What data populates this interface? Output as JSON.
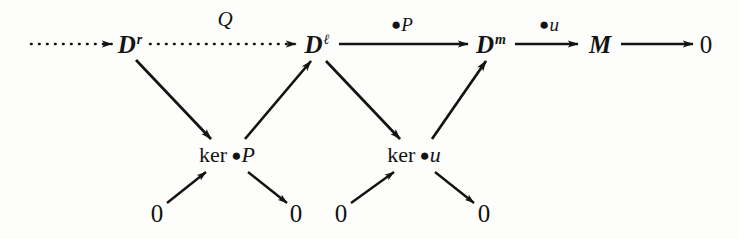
{
  "figure": {
    "kind": "commutative-diagram",
    "background": "#fdfdfb",
    "ink": "#131313",
    "width": 739,
    "height": 239
  },
  "nodes": {
    "d_r": {
      "base": "D",
      "sup": "r"
    },
    "d_l": {
      "base": "D",
      "sup": "ℓ"
    },
    "d_m": {
      "base": "D",
      "sup": "m"
    },
    "m": {
      "base": "M",
      "sup": ""
    },
    "zero_top_right": "0",
    "ker_p": {
      "word": "ker",
      "bullet": "●",
      "op": "P"
    },
    "ker_u": {
      "word": "ker",
      "bullet": "●",
      "op": "u"
    },
    "zero_1": "0",
    "zero_2": "0",
    "zero_3": "0",
    "zero_4": "0"
  },
  "edge_labels": {
    "q": "Q",
    "p": {
      "bullet": "●",
      "op": "P"
    },
    "u": {
      "bullet": "●",
      "op": "u"
    }
  },
  "edges": [
    {
      "name": "incoming-dotted-to-Dr",
      "from": "",
      "to": "d_r",
      "style": "dotted",
      "label": ""
    },
    {
      "name": "Dr-to-Dl",
      "from": "d_r",
      "to": "d_l",
      "style": "dotted",
      "label": "Q"
    },
    {
      "name": "Dl-to-Dm",
      "from": "d_l",
      "to": "d_m",
      "style": "solid",
      "label": "●P"
    },
    {
      "name": "Dm-to-M",
      "from": "d_m",
      "to": "m",
      "style": "solid",
      "label": "●u"
    },
    {
      "name": "M-to-zero",
      "from": "m",
      "to": "zero_top_right",
      "style": "solid",
      "label": ""
    },
    {
      "name": "Dr-to-kerP",
      "from": "d_r",
      "to": "ker_p",
      "style": "solid",
      "label": ""
    },
    {
      "name": "kerP-to-Dl",
      "from": "ker_p",
      "to": "d_l",
      "style": "solid",
      "label": ""
    },
    {
      "name": "Dl-to-keru",
      "from": "d_l",
      "to": "ker_u",
      "style": "solid",
      "label": ""
    },
    {
      "name": "keru-to-Dm",
      "from": "ker_u",
      "to": "d_m",
      "style": "solid",
      "label": ""
    },
    {
      "name": "zero1-to-kerP",
      "from": "zero_1",
      "to": "ker_p",
      "style": "solid",
      "label": ""
    },
    {
      "name": "kerP-to-zero2",
      "from": "ker_p",
      "to": "zero_2",
      "style": "solid",
      "label": ""
    },
    {
      "name": "zero3-to-keru",
      "from": "zero_3",
      "to": "ker_u",
      "style": "solid",
      "label": ""
    },
    {
      "name": "keru-to-zero4",
      "from": "ker_u",
      "to": "zero_4",
      "style": "solid",
      "label": ""
    }
  ]
}
